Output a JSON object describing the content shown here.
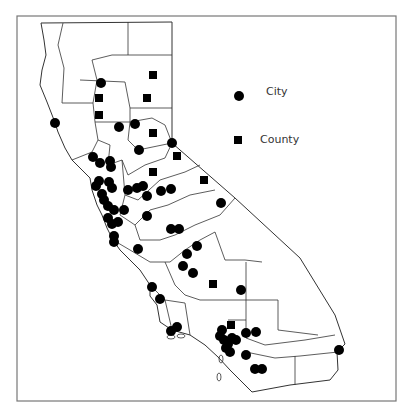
{
  "legend": {
    "city_label": "City",
    "county_label": "County"
  },
  "colors": {
    "marker": "#000000",
    "boundary": "#333333",
    "frame": "#777777",
    "background": "#ffffff"
  },
  "cities": [
    [
      101,
      83
    ],
    [
      55,
      123
    ],
    [
      119,
      127
    ],
    [
      135,
      124
    ],
    [
      172,
      143
    ],
    [
      139,
      150
    ],
    [
      93,
      157
    ],
    [
      100,
      163
    ],
    [
      110,
      161
    ],
    [
      111,
      167
    ],
    [
      99,
      181
    ],
    [
      96,
      186
    ],
    [
      109,
      182
    ],
    [
      112,
      188
    ],
    [
      102,
      194
    ],
    [
      104,
      200
    ],
    [
      108,
      206
    ],
    [
      114,
      210
    ],
    [
      108,
      218
    ],
    [
      112,
      224
    ],
    [
      118,
      222
    ],
    [
      124,
      210
    ],
    [
      128,
      190
    ],
    [
      137,
      188
    ],
    [
      143,
      186
    ],
    [
      147,
      196
    ],
    [
      161,
      191
    ],
    [
      171,
      189
    ],
    [
      147,
      216
    ],
    [
      171,
      229
    ],
    [
      179,
      229
    ],
    [
      197,
      246
    ],
    [
      187,
      254
    ],
    [
      183,
      266
    ],
    [
      221,
      203
    ],
    [
      138,
      249
    ],
    [
      114,
      236
    ],
    [
      114,
      242
    ],
    [
      193,
      273
    ],
    [
      241,
      290
    ],
    [
      152,
      287
    ],
    [
      160,
      299
    ],
    [
      171,
      331
    ],
    [
      177,
      327
    ],
    [
      220,
      336
    ],
    [
      224,
      340
    ],
    [
      228,
      344
    ],
    [
      232,
      338
    ],
    [
      226,
      348
    ],
    [
      230,
      352
    ],
    [
      236,
      340
    ],
    [
      222,
      330
    ],
    [
      246,
      333
    ],
    [
      256,
      332
    ],
    [
      246,
      355
    ],
    [
      255,
      369
    ],
    [
      262,
      369
    ],
    [
      339,
      350
    ]
  ],
  "counties": [
    [
      153,
      75
    ],
    [
      99,
      98
    ],
    [
      147,
      98
    ],
    [
      99,
      115
    ],
    [
      153,
      133
    ],
    [
      177,
      156
    ],
    [
      153,
      172
    ],
    [
      204,
      180
    ],
    [
      213,
      284
    ],
    [
      231,
      325
    ]
  ]
}
